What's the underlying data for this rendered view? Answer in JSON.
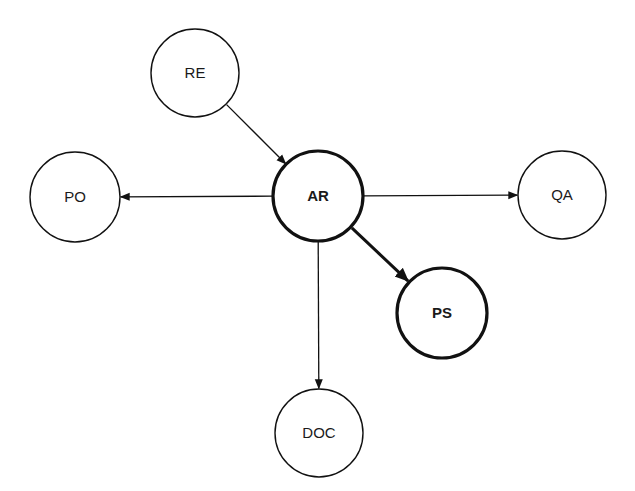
{
  "diagram": {
    "type": "directed-graph",
    "nodes": [
      {
        "id": "RE",
        "label": "RE",
        "cx": 195,
        "cy": 73,
        "r": 44,
        "emphasis": false
      },
      {
        "id": "AR",
        "label": "AR",
        "cx": 318,
        "cy": 196,
        "r": 45,
        "emphasis": true
      },
      {
        "id": "PO",
        "label": "PO",
        "cx": 75,
        "cy": 197,
        "r": 45,
        "emphasis": false
      },
      {
        "id": "QA",
        "label": "QA",
        "cx": 562,
        "cy": 195,
        "r": 44,
        "emphasis": false
      },
      {
        "id": "PS",
        "label": "PS",
        "cx": 442,
        "cy": 313,
        "r": 45,
        "emphasis": true
      },
      {
        "id": "DOC",
        "label": "DOC",
        "cx": 319,
        "cy": 433,
        "r": 44,
        "emphasis": false
      }
    ],
    "edges": [
      {
        "from": "RE",
        "to": "AR",
        "emphasis": false
      },
      {
        "from": "AR",
        "to": "PO",
        "emphasis": false
      },
      {
        "from": "AR",
        "to": "QA",
        "emphasis": false
      },
      {
        "from": "AR",
        "to": "PS",
        "emphasis": true
      },
      {
        "from": "AR",
        "to": "DOC",
        "emphasis": false
      }
    ],
    "colors": {
      "stroke": "#111111",
      "background": "#ffffff",
      "text": "#1a1a1a"
    }
  }
}
